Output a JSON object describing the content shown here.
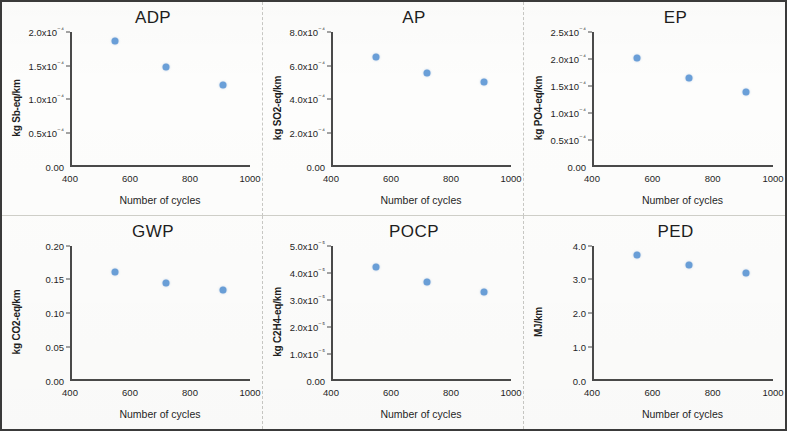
{
  "figure": {
    "marker_color": "#6a9fd8",
    "axis_color": "#4a4a4a",
    "xlabel": "Number of cycles",
    "xticks": [
      "400",
      "600",
      "800",
      "1000"
    ],
    "xlim": [
      400,
      1000
    ]
  },
  "chart_data": [
    {
      "type": "scatter",
      "title": "ADP",
      "xlabel": "Number of cycles",
      "ylabel": "kg Sb-eq/km",
      "x": [
        550,
        720,
        910
      ],
      "values": [
        0.000187,
        0.000148,
        0.000121
      ],
      "xlim": [
        400,
        1000
      ],
      "ylim": [
        0,
        0.0002
      ],
      "yticks": [
        "0.00",
        "0.5x10⁻⁴",
        "1.0x10⁻⁴",
        "1.5x10⁻⁴",
        "2.0x10⁻⁴"
      ],
      "ytick_values": [
        0,
        5e-05,
        0.0001,
        0.00015,
        0.0002
      ],
      "grid": false,
      "legend": "none"
    },
    {
      "type": "scatter",
      "title": "AP",
      "xlabel": "Number of cycles",
      "ylabel": "kg SO2-eq/km",
      "x": [
        550,
        720,
        910
      ],
      "values": [
        0.00065,
        0.000557,
        0.000502
      ],
      "xlim": [
        400,
        1000
      ],
      "ylim": [
        0,
        0.0008
      ],
      "yticks": [
        "0.00",
        "2.0x10⁻⁴",
        "4.0x10⁻⁴",
        "6.0x10⁻⁴",
        "8.0x10⁻⁴"
      ],
      "ytick_values": [
        0,
        0.0002,
        0.0004,
        0.0006,
        0.0008
      ],
      "grid": false,
      "legend": "none"
    },
    {
      "type": "scatter",
      "title": "EP",
      "xlabel": "Number of cycles",
      "ylabel": "kg PO4-eq/km",
      "x": [
        550,
        720,
        910
      ],
      "values": [
        0.000202,
        0.000165,
        0.000138
      ],
      "xlim": [
        400,
        1000
      ],
      "ylim": [
        0,
        0.00025
      ],
      "yticks": [
        "0.00",
        "0.5x10⁻⁴",
        "1.0x10⁻⁴",
        "1.5x10⁻⁴",
        "2.0x10⁻⁴",
        "2.5x10⁻⁴"
      ],
      "ytick_values": [
        0,
        5e-05,
        0.0001,
        0.00015,
        0.0002,
        0.00025
      ],
      "grid": false,
      "legend": "none"
    },
    {
      "type": "scatter",
      "title": "GWP",
      "xlabel": "Number of cycles",
      "ylabel": "kg CO2-eq/km",
      "x": [
        550,
        720,
        910
      ],
      "values": [
        0.161,
        0.145,
        0.135
      ],
      "xlim": [
        400,
        1000
      ],
      "ylim": [
        0,
        0.2
      ],
      "yticks": [
        "0.00",
        "0.05",
        "0.10",
        "0.15",
        "0.20"
      ],
      "ytick_values": [
        0,
        0.05,
        0.1,
        0.15,
        0.2
      ],
      "grid": false,
      "legend": "none"
    },
    {
      "type": "scatter",
      "title": "POCP",
      "xlabel": "Number of cycles",
      "ylabel": "kg C2H4-eq/km",
      "x": [
        550,
        720,
        910
      ],
      "values": [
        4.22e-05,
        3.64e-05,
        3.27e-05
      ],
      "xlim": [
        400,
        1000
      ],
      "ylim": [
        0,
        5e-05
      ],
      "yticks": [
        "0.00",
        "1.0x10⁻⁵",
        "2.0x10⁻⁵",
        "3.0x10⁻⁵",
        "4.0x10⁻⁵",
        "5.0x10⁻⁵"
      ],
      "ytick_values": [
        0,
        1e-05,
        2e-05,
        3e-05,
        4e-05,
        5e-05
      ],
      "grid": false,
      "legend": "none"
    },
    {
      "type": "scatter",
      "title": "PED",
      "xlabel": "Number of cycles",
      "ylabel": "MJ/km",
      "x": [
        550,
        720,
        910
      ],
      "values": [
        3.73,
        3.41,
        3.19
      ],
      "xlim": [
        400,
        1000
      ],
      "ylim": [
        0,
        4.0
      ],
      "yticks": [
        "0.0",
        "1.0",
        "2.0",
        "3.0",
        "4.0"
      ],
      "ytick_values": [
        0,
        1,
        2,
        3,
        4
      ],
      "grid": false,
      "legend": "none"
    }
  ]
}
